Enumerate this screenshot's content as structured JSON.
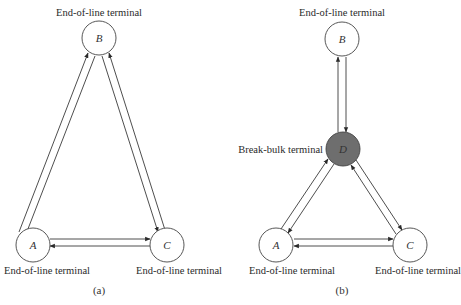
{
  "colors": {
    "node_fill": "#ffffff",
    "hub_fill": "#6e6e6e",
    "stroke": "#3a3a3a"
  },
  "diagram_a": {
    "caption": "(a)",
    "nodes": [
      {
        "id": "B",
        "label": "B",
        "role": "End-of-line terminal"
      },
      {
        "id": "A",
        "label": "A",
        "role": "End-of-line terminal"
      },
      {
        "id": "C",
        "label": "C",
        "role": "End-of-line terminal"
      }
    ],
    "edges": [
      {
        "from": "A",
        "to": "B"
      },
      {
        "from": "B",
        "to": "A"
      },
      {
        "from": "B",
        "to": "C"
      },
      {
        "from": "C",
        "to": "B"
      },
      {
        "from": "A",
        "to": "C"
      },
      {
        "from": "C",
        "to": "A"
      }
    ]
  },
  "diagram_b": {
    "caption": "(b)",
    "nodes": [
      {
        "id": "B",
        "label": "B",
        "role": "End-of-line terminal"
      },
      {
        "id": "D",
        "label": "D",
        "role": "Break-bulk terminal"
      },
      {
        "id": "A",
        "label": "A",
        "role": "End-of-line terminal"
      },
      {
        "id": "C",
        "label": "C",
        "role": "End-of-line terminal"
      }
    ],
    "edges": [
      {
        "from": "D",
        "to": "B"
      },
      {
        "from": "B",
        "to": "D"
      },
      {
        "from": "A",
        "to": "D"
      },
      {
        "from": "D",
        "to": "A"
      },
      {
        "from": "D",
        "to": "C"
      },
      {
        "from": "C",
        "to": "D"
      },
      {
        "from": "A",
        "to": "C"
      },
      {
        "from": "C",
        "to": "A"
      }
    ]
  }
}
